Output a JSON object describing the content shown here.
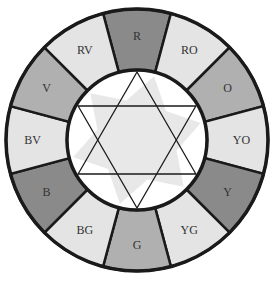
{
  "diagram": {
    "type": "color-wheel",
    "center": {
      "x": 137,
      "y": 140
    },
    "outer_radius": 131,
    "inner_radius": 70,
    "colors": {
      "primary": "#8a8a8a",
      "secondary": "#b0b0b0",
      "tertiary": "#e4e4e4",
      "stroke": "#1a1a1a",
      "center_fill": "#ffffff",
      "star_shadow": "#e8e8e8"
    },
    "segments": [
      {
        "label": "R",
        "kind": "primary"
      },
      {
        "label": "RO",
        "kind": "tertiary"
      },
      {
        "label": "O",
        "kind": "secondary"
      },
      {
        "label": "YO",
        "kind": "tertiary"
      },
      {
        "label": "Y",
        "kind": "primary"
      },
      {
        "label": "YG",
        "kind": "tertiary"
      },
      {
        "label": "G",
        "kind": "secondary"
      },
      {
        "label": "BG",
        "kind": "tertiary"
      },
      {
        "label": "B",
        "kind": "primary"
      },
      {
        "label": "BV",
        "kind": "tertiary"
      },
      {
        "label": "V",
        "kind": "secondary"
      },
      {
        "label": "RV",
        "kind": "tertiary"
      }
    ],
    "center_symbol": "six-pointed-star"
  }
}
